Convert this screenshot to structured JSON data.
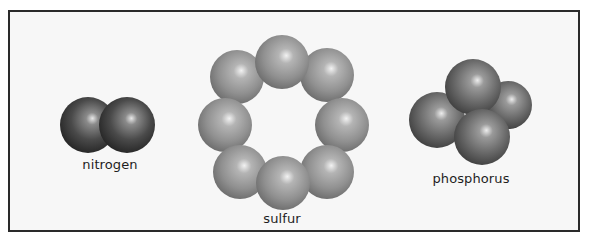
{
  "figure": {
    "molecules": [
      {
        "name": "nitrogen",
        "label": "nitrogen",
        "atom_count": 2,
        "color": "#4a4a4a",
        "label_pos": {
          "x": 110,
          "y": 157
        },
        "atoms": [
          {
            "cx": 88,
            "cy": 125,
            "r": 28
          },
          {
            "cx": 127,
            "cy": 125,
            "r": 28
          }
        ]
      },
      {
        "name": "sulfur",
        "label": "sulfur",
        "atom_count": 8,
        "color": "#8e8e8e",
        "label_pos": {
          "x": 282,
          "y": 211
        },
        "atoms": [
          {
            "cx": 237,
            "cy": 77,
            "r": 27
          },
          {
            "cx": 327,
            "cy": 75,
            "r": 27
          },
          {
            "cx": 282,
            "cy": 62,
            "r": 27
          },
          {
            "cx": 225,
            "cy": 125,
            "r": 27
          },
          {
            "cx": 342,
            "cy": 125,
            "r": 27
          },
          {
            "cx": 240,
            "cy": 172,
            "r": 27
          },
          {
            "cx": 327,
            "cy": 172,
            "r": 27
          },
          {
            "cx": 283,
            "cy": 183,
            "r": 27
          }
        ]
      },
      {
        "name": "phosphorus",
        "label": "phosphorus",
        "atom_count": 4,
        "color": "#6a6a6a",
        "label_pos": {
          "x": 471,
          "y": 171
        },
        "atoms": [
          {
            "cx": 508,
            "cy": 105,
            "r": 24
          },
          {
            "cx": 437,
            "cy": 120,
            "r": 28
          },
          {
            "cx": 473,
            "cy": 87,
            "r": 28
          },
          {
            "cx": 482,
            "cy": 137,
            "r": 28
          }
        ]
      }
    ]
  }
}
